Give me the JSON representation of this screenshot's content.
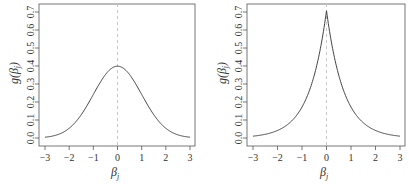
{
  "chart_data": [
    {
      "type": "line",
      "title": "",
      "xlabel": "β_j",
      "ylabel": "g(β_j)",
      "distribution": "Normal(0,1) density",
      "xlim": [
        -3,
        3
      ],
      "ylim": [
        0.0,
        0.7
      ],
      "xticks": [
        -3,
        -2,
        -1,
        0,
        1,
        2,
        3
      ],
      "xtick_labels": [
        "−3",
        "−2",
        "−1",
        "0",
        "1",
        "2",
        "3"
      ],
      "yticks": [
        0.0,
        0.1,
        0.2,
        0.3,
        0.4,
        0.5,
        0.6,
        0.7
      ],
      "ytick_labels": [
        "0.0",
        "0.1",
        "0.2",
        "0.3",
        "0.4",
        "0.5",
        "0.6",
        "0.7"
      ],
      "reference_line": {
        "x": 0,
        "style": "dashed",
        "color": "#c8c8c8"
      },
      "grid": false,
      "legend": null,
      "x": [
        -3,
        -2.5,
        -2,
        -1.5,
        -1,
        -0.5,
        0,
        0.5,
        1,
        1.5,
        2,
        2.5,
        3
      ],
      "series": [
        {
          "name": "g(β_j)",
          "color": "#444444",
          "values": [
            0.004,
            0.018,
            0.054,
            0.13,
            0.242,
            0.352,
            0.399,
            0.352,
            0.242,
            0.13,
            0.054,
            0.018,
            0.004
          ]
        }
      ]
    },
    {
      "type": "line",
      "title": "",
      "xlabel": "β_j",
      "ylabel": "g(β_j)",
      "distribution": "Laplace(0, 1/√2) density",
      "xlim": [
        -3,
        3
      ],
      "ylim": [
        0.0,
        0.7
      ],
      "xticks": [
        -3,
        -2,
        -1,
        0,
        1,
        2,
        3
      ],
      "xtick_labels": [
        "−3",
        "−2",
        "−1",
        "0",
        "1",
        "2",
        "3"
      ],
      "yticks": [
        0.0,
        0.1,
        0.2,
        0.3,
        0.4,
        0.5,
        0.6,
        0.7
      ],
      "ytick_labels": [
        "0.0",
        "0.1",
        "0.2",
        "0.3",
        "0.4",
        "0.5",
        "0.6",
        "0.7"
      ],
      "reference_line": {
        "x": 0,
        "style": "dashed",
        "color": "#c8c8c8"
      },
      "grid": false,
      "legend": null,
      "x": [
        -3,
        -2.5,
        -2,
        -1.5,
        -1,
        -0.5,
        0,
        0.5,
        1,
        1.5,
        2,
        2.5,
        3
      ],
      "series": [
        {
          "name": "g(β_j)",
          "color": "#444444",
          "values": [
            0.01,
            0.021,
            0.042,
            0.085,
            0.172,
            0.349,
            0.707,
            0.349,
            0.172,
            0.085,
            0.042,
            0.021,
            0.01
          ]
        }
      ]
    }
  ],
  "panels": [
    {
      "ylabel_main": "g",
      "ylabel_sub": "j",
      "xlabel_main": "β",
      "xlabel_sub": "j",
      "density": "normal"
    },
    {
      "ylabel_main": "g",
      "ylabel_sub": "j",
      "xlabel_main": "β",
      "xlabel_sub": "j",
      "density": "laplace"
    }
  ]
}
